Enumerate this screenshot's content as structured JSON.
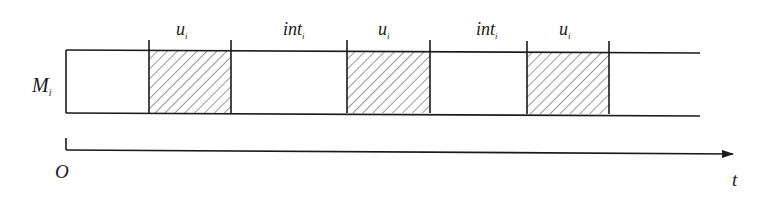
{
  "diagram": {
    "machine_label": "M",
    "machine_subscript": "i",
    "origin_label": "O",
    "axis_label": "t",
    "segments": [
      {
        "type": "idle",
        "label": "",
        "subscript": "",
        "x0": 66,
        "x1": 149
      },
      {
        "type": "busy",
        "label": "u",
        "subscript": "i",
        "x0": 149,
        "x1": 231
      },
      {
        "type": "idle",
        "label": "int",
        "subscript": "i",
        "x0": 231,
        "x1": 347
      },
      {
        "type": "busy",
        "label": "u",
        "subscript": "i",
        "x0": 347,
        "x1": 430
      },
      {
        "type": "idle",
        "label": "int",
        "subscript": "i",
        "x0": 430,
        "x1": 527
      },
      {
        "type": "busy",
        "label": "u",
        "subscript": "i",
        "x0": 527,
        "x1": 609
      },
      {
        "type": "idle",
        "label": "",
        "subscript": "",
        "x0": 609,
        "x1": 700
      }
    ],
    "colors": {
      "line": "#1a1a1a",
      "hatch": "#333333",
      "background": "#ffffff"
    }
  }
}
